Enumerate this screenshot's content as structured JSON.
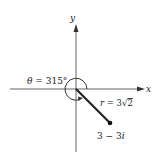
{
  "diagram": {
    "axes": {
      "x_label": "x",
      "y_label": "y"
    },
    "angle_label": "θ = 315°",
    "modulus_label_prefix": "r = 3",
    "modulus_radicand": "2",
    "point_label": "3 − 3i",
    "colors": {
      "ink": "#222222",
      "axis": "#444444",
      "background": "#ffffff"
    }
  }
}
